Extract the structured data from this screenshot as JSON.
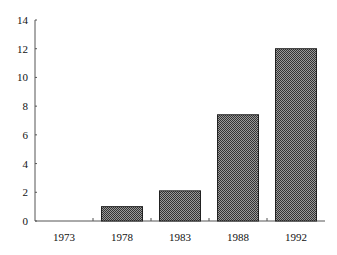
{
  "chart_data": {
    "type": "bar",
    "title": "",
    "xlabel": "",
    "ylabel": "",
    "categories": [
      "1973",
      "1978",
      "1983",
      "1988",
      "1992"
    ],
    "values": [
      0,
      1.0,
      2.1,
      7.4,
      12.0
    ],
    "ylim": [
      0,
      14
    ],
    "yticks": [
      "0",
      "2",
      "4",
      "6",
      "8",
      "10",
      "12",
      "14"
    ],
    "grid": false,
    "legend": null,
    "bar_fill": "crosshatch-gray",
    "colors": {
      "bar": "#6e6e6e",
      "axis": "#555555"
    }
  }
}
